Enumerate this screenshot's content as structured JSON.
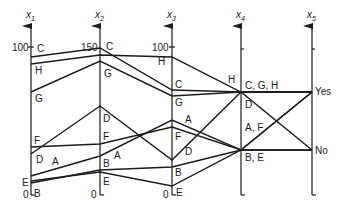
{
  "diagram": {
    "type": "parallel-coordinates",
    "axes": [
      {
        "name": "x1",
        "top_label": "100",
        "bottom_label": "0"
      },
      {
        "name": "x2",
        "top_label": "150",
        "bottom_label": "0"
      },
      {
        "name": "x3",
        "top_label": "100",
        "bottom_label": "0"
      },
      {
        "name": "x4",
        "top_label": "",
        "bottom_label": ""
      },
      {
        "name": "x5",
        "top_label": "",
        "bottom_label": ""
      }
    ],
    "x5_values": {
      "yes": "Yes",
      "no": "No"
    },
    "records": [
      "A",
      "B",
      "C",
      "D",
      "E",
      "F",
      "G",
      "H"
    ],
    "x4_group_labels": {
      "top": "C, G, H",
      "middle_d": "D",
      "middle_af": "A, F",
      "bottom": "B, E"
    },
    "point_labels": {
      "x1": [
        "C",
        "H",
        "G",
        "F",
        "D",
        "A",
        "E",
        "B"
      ],
      "x2": [
        "C",
        "G",
        "D",
        "F",
        "A",
        "B",
        "E"
      ],
      "x3": [
        "H",
        "C",
        "G",
        "A",
        "F",
        "D",
        "B",
        "E"
      ],
      "x4": [
        "H"
      ]
    }
  }
}
